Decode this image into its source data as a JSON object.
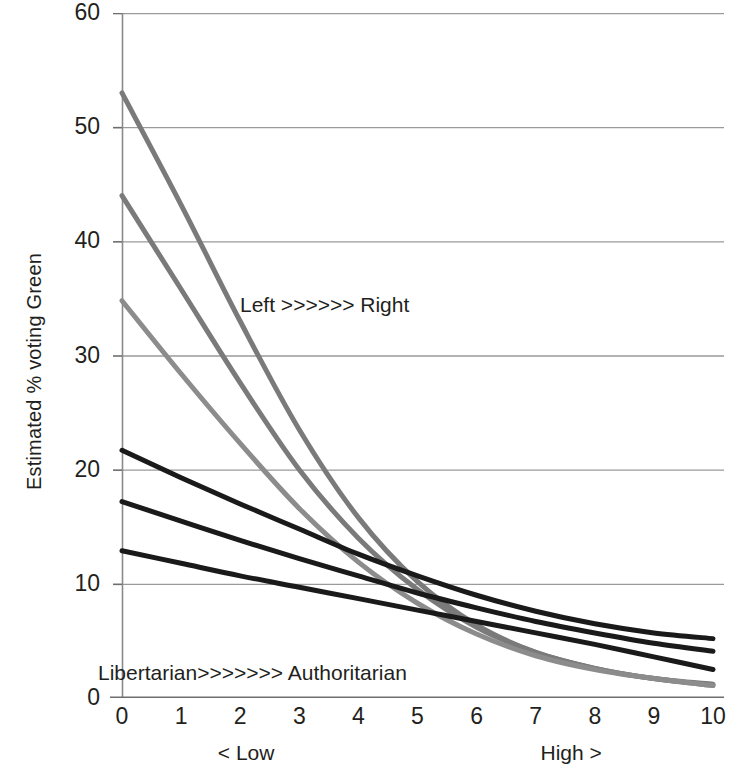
{
  "chart_data": {
    "type": "line",
    "title": "",
    "xlabel": "",
    "ylabel": "Estimated % voting Green",
    "xlim": [
      0,
      10
    ],
    "ylim": [
      0,
      60
    ],
    "grid": true,
    "legend": "none",
    "x_tick_labels": [
      "0",
      "1",
      "2",
      "3",
      "4",
      "5",
      "6",
      "7",
      "8",
      "9",
      "10"
    ],
    "y_tick_labels": [
      "0",
      "10",
      "20",
      "30",
      "40",
      "50",
      "60"
    ],
    "x_axis_captions": [
      {
        "text": "< Low",
        "at_x": 2.1
      },
      {
        "text": "High >",
        "at_x": 7.6
      }
    ],
    "annotations": [
      {
        "text": "Left >>>>>> Right",
        "at_x": 2.4,
        "at_y": 35.9
      },
      {
        "text": "Libertarian>>>>>>> Authoritarian",
        "at_x": 0.0,
        "at_y": 3.2
      }
    ],
    "x": [
      0,
      1,
      2,
      3,
      4,
      5,
      6,
      7,
      8,
      9,
      10
    ],
    "series": [
      {
        "name": "Left, high libertarian",
        "color": "#7a7a7a",
        "width": 5,
        "values": [
          53.0,
          43.2,
          33.0,
          23.5,
          15.8,
          10.2,
          6.4,
          4.0,
          2.6,
          1.7,
          1.2
        ]
      },
      {
        "name": "Centre-left, high libertarian",
        "color": "#7a7a7a",
        "width": 5,
        "values": [
          44.0,
          35.8,
          27.6,
          20.0,
          14.0,
          9.5,
          6.2,
          4.0,
          2.6,
          1.7,
          1.1
        ]
      },
      {
        "name": "Centre, high libertarian",
        "color": "#8c8c8c",
        "width": 5,
        "values": [
          34.8,
          28.4,
          22.3,
          16.6,
          11.9,
          8.3,
          5.6,
          3.7,
          2.5,
          1.7,
          1.1
        ]
      },
      {
        "name": "Left, low libertarian",
        "color": "#1a1a1a",
        "width": 5,
        "values": [
          21.7,
          19.3,
          17.0,
          14.8,
          12.6,
          10.7,
          9.0,
          7.6,
          6.5,
          5.7,
          5.2
        ]
      },
      {
        "name": "Centre-left, low libertarian",
        "color": "#1a1a1a",
        "width": 5,
        "values": [
          17.2,
          15.5,
          13.8,
          12.2,
          10.7,
          9.2,
          7.9,
          6.7,
          5.7,
          4.8,
          4.1
        ]
      },
      {
        "name": "Centre, low libertarian",
        "color": "#1a1a1a",
        "width": 5,
        "values": [
          12.9,
          11.8,
          10.7,
          9.7,
          8.7,
          7.7,
          6.7,
          5.7,
          4.7,
          3.6,
          2.5
        ]
      }
    ]
  }
}
